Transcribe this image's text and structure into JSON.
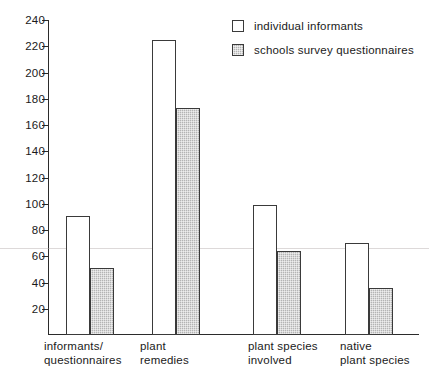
{
  "chart_data": {
    "type": "bar",
    "title": "",
    "subtitle": "",
    "xlabel": "",
    "ylabel": "",
    "ylim": [
      0,
      240
    ],
    "ytick_step": 20,
    "yticks": [
      20,
      40,
      60,
      80,
      100,
      120,
      140,
      160,
      180,
      200,
      220,
      240
    ],
    "grid": false,
    "legend_position": "top-right",
    "categories": [
      "informants/\nquestionnaires",
      "plant\nremedies",
      "plant species\ninvolved",
      "native\nplant species"
    ],
    "series": [
      {
        "name": "individual informants",
        "fill": "white",
        "values": [
          91,
          225,
          99,
          70
        ]
      },
      {
        "name": "schools survey questionnaires",
        "fill": "gray-hatched",
        "values": [
          51,
          173,
          64,
          36
        ]
      }
    ],
    "colors": {
      "series_white": "#ffffff",
      "series_gray": "#b4b4b4",
      "axis": "#2b2b2b",
      "text": "#1a1a1a",
      "background": "#ffffff"
    }
  },
  "legend": {
    "items": [
      {
        "label": "individual informants",
        "swatch": "legend-swatch-white"
      },
      {
        "label": "schools survey questionnaires",
        "swatch": "legend-swatch-gray-hatched"
      }
    ]
  },
  "axis": {
    "y": {
      "labels": [
        "240",
        "220",
        "200",
        "180",
        "160",
        "140",
        "120",
        "100",
        "80",
        "60",
        "40",
        "20"
      ]
    },
    "x": {
      "labels": [
        "informants/\nquestionnaires",
        "plant\nremedies",
        "plant species\ninvolved",
        "native\nplant species"
      ]
    }
  }
}
